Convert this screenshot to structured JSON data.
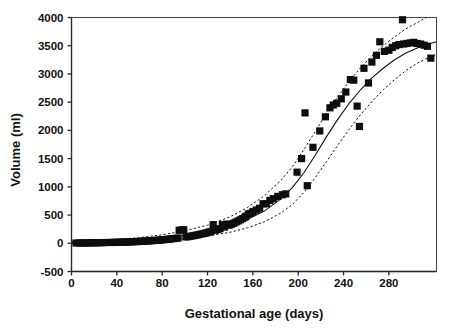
{
  "chart_data": {
    "type": "scatter",
    "title": "",
    "xlabel": "Gestational age (days)",
    "ylabel": "Volume (ml)",
    "xlim": [
      0,
      322
    ],
    "ylim": [
      -500,
      4000
    ],
    "xticks": [
      0,
      40,
      80,
      120,
      160,
      200,
      240,
      280
    ],
    "yticks": [
      -500,
      0,
      500,
      1000,
      1500,
      2000,
      2500,
      3000,
      3500,
      4000
    ],
    "xtick_labels": [
      "0",
      "40",
      "80",
      "120",
      "160",
      "200",
      "240",
      "280"
    ],
    "ytick_labels": [
      "-500",
      "0",
      "500",
      "1000",
      "1500",
      "2000",
      "2500",
      "3000",
      "3500",
      "4000"
    ],
    "grid": false,
    "legend": "none",
    "marker": "filled-square",
    "marker_color": "#0d0d0d",
    "series": [
      {
        "name": "Observed volume",
        "type": "scatter",
        "points": [
          [
            4,
            5
          ],
          [
            7,
            5
          ],
          [
            9,
            6
          ],
          [
            11,
            6
          ],
          [
            13,
            7
          ],
          [
            15,
            8
          ],
          [
            17,
            8
          ],
          [
            19,
            9
          ],
          [
            21,
            10
          ],
          [
            23,
            10
          ],
          [
            25,
            11
          ],
          [
            27,
            12
          ],
          [
            29,
            13
          ],
          [
            34,
            14
          ],
          [
            36,
            15
          ],
          [
            38,
            16
          ],
          [
            40,
            17
          ],
          [
            42,
            18
          ],
          [
            44,
            20
          ],
          [
            46,
            21
          ],
          [
            48,
            22
          ],
          [
            50,
            24
          ],
          [
            52,
            25
          ],
          [
            54,
            27
          ],
          [
            56,
            29
          ],
          [
            58,
            31
          ],
          [
            60,
            33
          ],
          [
            62,
            35
          ],
          [
            64,
            37
          ],
          [
            66,
            40
          ],
          [
            68,
            42
          ],
          [
            70,
            45
          ],
          [
            72,
            48
          ],
          [
            74,
            51
          ],
          [
            76,
            54
          ],
          [
            78,
            58
          ],
          [
            80,
            61
          ],
          [
            82,
            65
          ],
          [
            84,
            69
          ],
          [
            86,
            73
          ],
          [
            88,
            78
          ],
          [
            90,
            83
          ],
          [
            92,
            88
          ],
          [
            94,
            93
          ],
          [
            95,
            230
          ],
          [
            97,
            235
          ],
          [
            99,
            240
          ],
          [
            101,
            112
          ],
          [
            103,
            118
          ],
          [
            105,
            125
          ],
          [
            107,
            132
          ],
          [
            109,
            140
          ],
          [
            111,
            148
          ],
          [
            113,
            157
          ],
          [
            115,
            166
          ],
          [
            117,
            175
          ],
          [
            119,
            185
          ],
          [
            121,
            196
          ],
          [
            123,
            208
          ],
          [
            125,
            330
          ],
          [
            127,
            232
          ],
          [
            129,
            245
          ],
          [
            131,
            259
          ],
          [
            133,
            330
          ],
          [
            135,
            288
          ],
          [
            137,
            340
          ],
          [
            139,
            320
          ],
          [
            141,
            337
          ],
          [
            143,
            355
          ],
          [
            145,
            375
          ],
          [
            147,
            395
          ],
          [
            149,
            416
          ],
          [
            151,
            438
          ],
          [
            153,
            460
          ],
          [
            154,
            480
          ],
          [
            156,
            520
          ],
          [
            158,
            530
          ],
          [
            160,
            560
          ],
          [
            163,
            590
          ],
          [
            166,
            620
          ],
          [
            169,
            700
          ],
          [
            172,
            700
          ],
          [
            175,
            760
          ],
          [
            178,
            790
          ],
          [
            182,
            830
          ],
          [
            186,
            860
          ],
          [
            189,
            875
          ],
          [
            199,
            1260
          ],
          [
            203,
            1500
          ],
          [
            206,
            2310
          ],
          [
            208,
            1020
          ],
          [
            213,
            1700
          ],
          [
            219,
            1990
          ],
          [
            224,
            2240
          ],
          [
            228,
            2400
          ],
          [
            231,
            2450
          ],
          [
            234,
            2480
          ],
          [
            238,
            2560
          ],
          [
            242,
            2680
          ],
          [
            246,
            2900
          ],
          [
            249,
            2890
          ],
          [
            252,
            2430
          ],
          [
            254,
            2070
          ],
          [
            258,
            3100
          ],
          [
            262,
            2840
          ],
          [
            265,
            3210
          ],
          [
            269,
            3330
          ],
          [
            272,
            3570
          ],
          [
            276,
            3400
          ],
          [
            280,
            3420
          ],
          [
            283,
            3470
          ],
          [
            286,
            3500
          ],
          [
            289,
            3520
          ],
          [
            292,
            3960
          ],
          [
            293,
            3530
          ],
          [
            296,
            3540
          ],
          [
            299,
            3550
          ],
          [
            302,
            3560
          ],
          [
            305,
            3540
          ],
          [
            308,
            3530
          ],
          [
            311,
            3510
          ],
          [
            314,
            3490
          ],
          [
            317,
            3280
          ]
        ]
      },
      {
        "name": "Fitted growth curve",
        "type": "line",
        "style": "solid",
        "points": [
          [
            0,
            8
          ],
          [
            20,
            18
          ],
          [
            40,
            34
          ],
          [
            60,
            58
          ],
          [
            80,
            92
          ],
          [
            100,
            140
          ],
          [
            120,
            208
          ],
          [
            140,
            310
          ],
          [
            155,
            420
          ],
          [
            170,
            570
          ],
          [
            185,
            790
          ],
          [
            195,
            990
          ],
          [
            205,
            1250
          ],
          [
            215,
            1560
          ],
          [
            225,
            1890
          ],
          [
            235,
            2200
          ],
          [
            245,
            2480
          ],
          [
            255,
            2720
          ],
          [
            265,
            2930
          ],
          [
            275,
            3100
          ],
          [
            285,
            3250
          ],
          [
            295,
            3370
          ],
          [
            305,
            3460
          ],
          [
            315,
            3530
          ],
          [
            322,
            3570
          ]
        ]
      },
      {
        "name": "Upper confidence band",
        "type": "line",
        "style": "dashed",
        "points": [
          [
            0,
            30
          ],
          [
            20,
            45
          ],
          [
            40,
            68
          ],
          [
            60,
            100
          ],
          [
            80,
            150
          ],
          [
            100,
            222
          ],
          [
            120,
            320
          ],
          [
            140,
            470
          ],
          [
            155,
            630
          ],
          [
            170,
            840
          ],
          [
            185,
            1120
          ],
          [
            195,
            1360
          ],
          [
            205,
            1660
          ],
          [
            215,
            1980
          ],
          [
            225,
            2300
          ],
          [
            235,
            2600
          ],
          [
            245,
            2870
          ],
          [
            255,
            3110
          ],
          [
            265,
            3320
          ],
          [
            275,
            3500
          ],
          [
            285,
            3660
          ],
          [
            295,
            3800
          ],
          [
            305,
            3910
          ],
          [
            313,
            4000
          ]
        ]
      },
      {
        "name": "Lower confidence band",
        "type": "line",
        "style": "dashed",
        "points": [
          [
            0,
            -8
          ],
          [
            20,
            -2
          ],
          [
            40,
            8
          ],
          [
            60,
            24
          ],
          [
            80,
            48
          ],
          [
            100,
            82
          ],
          [
            120,
            128
          ],
          [
            140,
            196
          ],
          [
            155,
            272
          ],
          [
            170,
            380
          ],
          [
            185,
            540
          ],
          [
            195,
            690
          ],
          [
            205,
            900
          ],
          [
            215,
            1160
          ],
          [
            225,
            1450
          ],
          [
            235,
            1740
          ],
          [
            245,
            2020
          ],
          [
            255,
            2280
          ],
          [
            265,
            2510
          ],
          [
            275,
            2720
          ],
          [
            285,
            2900
          ],
          [
            295,
            3060
          ],
          [
            305,
            3190
          ],
          [
            315,
            3290
          ],
          [
            322,
            3350
          ]
        ]
      }
    ]
  }
}
